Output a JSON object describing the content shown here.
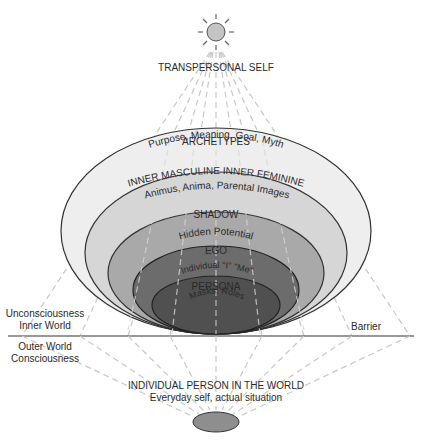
{
  "diagram": {
    "top_label": "TRANSPERSONAL SELF",
    "bottom_label_title": "INDIVIDUAL PERSON IN THE WORLD",
    "bottom_label_subtitle": "Everyday self, actual situation",
    "left_upper": [
      "Unconsciousness",
      "Inner World"
    ],
    "left_lower": [
      "Outer World",
      "Consciousness"
    ],
    "right_label": "Barrier",
    "layers": [
      {
        "name": "ARCHETYPES",
        "subtitle": "Purpose, Meaning, Goal, Myth",
        "color": "#eeeeee"
      },
      {
        "name": "INNER MASCULINE INNER FEMININE",
        "subtitle": "Animus, Anima, Parental Images",
        "color": "#d6d6d6"
      },
      {
        "name": "SHADOW",
        "subtitle": "Hidden Potential",
        "color": "#a9a9a9"
      },
      {
        "name": "EGO",
        "subtitle": "Individual \"I\" \"Me\"",
        "color": "#6c6c6c"
      },
      {
        "name": "PERSONA",
        "subtitle": "Masks, Roles",
        "color": "#505050"
      }
    ],
    "sun_color": "#c4c4c4",
    "person_color": "#8e8e8e",
    "line_color": "#333333",
    "ray_color": "#c8c8c8"
  }
}
